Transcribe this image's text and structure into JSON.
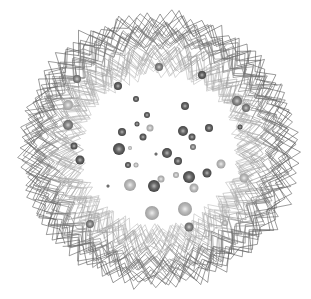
{
  "figure": {
    "width": 311,
    "height": 299,
    "background": "#ffffff",
    "center": [
      158,
      150
    ],
    "ring": {
      "inner_radius": 78,
      "outer_radius": 132,
      "strands": 34,
      "vertices_per_strand": 56,
      "jitter": 9,
      "dark_color": "#555555",
      "light_color": "#cfcfcf"
    },
    "spheres": [
      {
        "x": 159,
        "y": 67,
        "r": 4,
        "tone": "mid"
      },
      {
        "x": 202,
        "y": 75,
        "r": 4,
        "tone": "dark"
      },
      {
        "x": 77,
        "y": 79,
        "r": 4,
        "tone": "mid"
      },
      {
        "x": 118,
        "y": 86,
        "r": 4,
        "tone": "dark"
      },
      {
        "x": 136,
        "y": 99,
        "r": 3,
        "tone": "dark"
      },
      {
        "x": 185,
        "y": 106,
        "r": 4,
        "tone": "dark"
      },
      {
        "x": 237,
        "y": 101,
        "r": 5,
        "tone": "mid"
      },
      {
        "x": 246,
        "y": 108,
        "r": 4,
        "tone": "mid"
      },
      {
        "x": 68,
        "y": 105,
        "r": 5,
        "tone": "light"
      },
      {
        "x": 147,
        "y": 115,
        "r": 3,
        "tone": "dark"
      },
      {
        "x": 137,
        "y": 124,
        "r": 2.5,
        "tone": "dark"
      },
      {
        "x": 150,
        "y": 128,
        "r": 3.5,
        "tone": "light"
      },
      {
        "x": 122,
        "y": 132,
        "r": 4,
        "tone": "dark"
      },
      {
        "x": 183,
        "y": 131,
        "r": 5,
        "tone": "dark"
      },
      {
        "x": 209,
        "y": 128,
        "r": 4,
        "tone": "dark"
      },
      {
        "x": 240,
        "y": 127,
        "r": 2.5,
        "tone": "dark"
      },
      {
        "x": 68,
        "y": 125,
        "r": 5,
        "tone": "mid"
      },
      {
        "x": 143,
        "y": 137,
        "r": 3.5,
        "tone": "dark"
      },
      {
        "x": 192,
        "y": 137,
        "r": 3.5,
        "tone": "dark"
      },
      {
        "x": 193,
        "y": 147,
        "r": 3,
        "tone": "mid"
      },
      {
        "x": 74,
        "y": 146,
        "r": 3.5,
        "tone": "dark"
      },
      {
        "x": 119,
        "y": 149,
        "r": 6,
        "tone": "dark"
      },
      {
        "x": 130,
        "y": 148,
        "r": 2,
        "tone": "light"
      },
      {
        "x": 156,
        "y": 154,
        "r": 1.5,
        "tone": "dark"
      },
      {
        "x": 167,
        "y": 153,
        "r": 5,
        "tone": "dark"
      },
      {
        "x": 80,
        "y": 160,
        "r": 4.5,
        "tone": "dark"
      },
      {
        "x": 178,
        "y": 161,
        "r": 4,
        "tone": "dark"
      },
      {
        "x": 128,
        "y": 165,
        "r": 3,
        "tone": "dark"
      },
      {
        "x": 136,
        "y": 165,
        "r": 2.5,
        "tone": "light"
      },
      {
        "x": 221,
        "y": 164,
        "r": 4.5,
        "tone": "light"
      },
      {
        "x": 189,
        "y": 177,
        "r": 6,
        "tone": "dark"
      },
      {
        "x": 207,
        "y": 173,
        "r": 4.5,
        "tone": "dark"
      },
      {
        "x": 176,
        "y": 175,
        "r": 3,
        "tone": "light"
      },
      {
        "x": 161,
        "y": 179,
        "r": 3.5,
        "tone": "light"
      },
      {
        "x": 244,
        "y": 178,
        "r": 4.5,
        "tone": "light"
      },
      {
        "x": 130,
        "y": 185,
        "r": 6,
        "tone": "light"
      },
      {
        "x": 154,
        "y": 186,
        "r": 6,
        "tone": "dark"
      },
      {
        "x": 194,
        "y": 188,
        "r": 4.5,
        "tone": "light"
      },
      {
        "x": 108,
        "y": 186,
        "r": 1.5,
        "tone": "dark"
      },
      {
        "x": 152,
        "y": 213,
        "r": 7,
        "tone": "light"
      },
      {
        "x": 185,
        "y": 209,
        "r": 7,
        "tone": "light"
      },
      {
        "x": 189,
        "y": 227,
        "r": 4.5,
        "tone": "mid"
      },
      {
        "x": 90,
        "y": 224,
        "r": 4,
        "tone": "mid"
      },
      {
        "x": 225,
        "y": 223,
        "r": 3,
        "tone": "light"
      }
    ],
    "tones": {
      "dark": {
        "hi": "#b8b8b8",
        "mid": "#6a6a6a",
        "edge": "#3a3a3a"
      },
      "mid": {
        "hi": "#d0d0d0",
        "mid": "#8c8c8c",
        "edge": "#5c5c5c"
      },
      "light": {
        "hi": "#eeeeee",
        "mid": "#bdbdbd",
        "edge": "#999999"
      }
    }
  }
}
